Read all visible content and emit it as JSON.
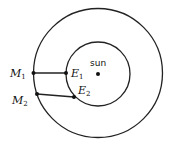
{
  "diagram": {
    "title": "",
    "sun_label": "sun",
    "orbits": [
      {
        "name": "earth-orbit",
        "cx": 98,
        "cy": 74,
        "r": 32
      },
      {
        "name": "mars-orbit",
        "cx": 98,
        "cy": 73,
        "r": 64.5
      }
    ],
    "points": [
      {
        "id": "M1",
        "letter": "M",
        "sub": "1",
        "x": 33.5,
        "y": 73,
        "label_x": 10,
        "label_y": 77
      },
      {
        "id": "E1",
        "letter": "E",
        "sub": "1",
        "x": 66,
        "y": 73,
        "label_x": 71,
        "label_y": 77
      },
      {
        "id": "M2",
        "letter": "M",
        "sub": "2",
        "x": 37,
        "y": 94,
        "label_x": 12,
        "label_y": 105
      },
      {
        "id": "E2",
        "letter": "E",
        "sub": "2",
        "x": 74,
        "y": 97,
        "label_x": 78,
        "label_y": 95
      }
    ],
    "lines": [
      [
        "M1",
        "E1"
      ],
      [
        "M2",
        "E2"
      ]
    ],
    "sun": {
      "x": 98,
      "y": 74
    }
  }
}
